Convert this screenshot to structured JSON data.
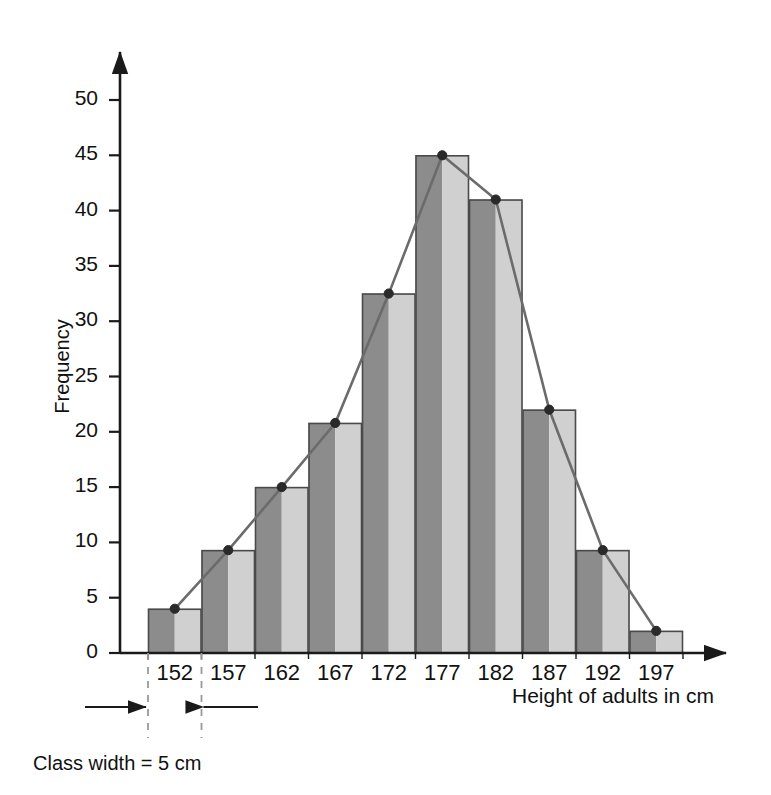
{
  "chart_data": {
    "type": "bar",
    "title": "",
    "subtitle": "",
    "xlabel": "Height of adults in cm",
    "ylabel": "Frequency",
    "categories": [
      "152",
      "157",
      "162",
      "167",
      "172",
      "177",
      "182",
      "187",
      "192",
      "197"
    ],
    "values": [
      4,
      9.3,
      15,
      20.8,
      32.5,
      45,
      41,
      22,
      9.3,
      2
    ],
    "series": [
      {
        "name": "Frequency",
        "values": [
          4,
          9.3,
          15,
          20.8,
          32.5,
          45,
          41,
          22,
          9.3,
          2
        ]
      },
      {
        "name": "Frequency polygon",
        "values": [
          4,
          9.3,
          15,
          20.8,
          32.5,
          45,
          41,
          22,
          9.3,
          2
        ]
      }
    ],
    "ylim": [
      0,
      55
    ],
    "xlim": [
      0,
      10
    ],
    "yticks": [
      0,
      5,
      10,
      15,
      20,
      25,
      30,
      35,
      40,
      45,
      50
    ],
    "ytick_labels": [
      "0",
      "5",
      "10",
      "15",
      "20",
      "25",
      "30",
      "35",
      "40",
      "45",
      "50"
    ],
    "xtick_labels": [
      "152",
      "157",
      "162",
      "167",
      "172",
      "177",
      "182",
      "187",
      "192",
      "197"
    ],
    "grid": false,
    "legend": "none",
    "annotations": [
      {
        "name": "class-width",
        "text": "Class width = 5 cm",
        "value": 5,
        "unit": "cm"
      }
    ]
  },
  "axes": {
    "y_title": "Frequency",
    "x_title": "Height of adults in cm"
  },
  "annotation": {
    "class_width_text": "Class width = 5 cm"
  },
  "colors": {
    "bar_dark": "#8c8c8c",
    "bar_light": "#d0d0d0",
    "bar_edge": "#4a4a4a",
    "axis": "#1a1a1a",
    "polygon_line": "#6b6b6b",
    "marker": "#2a2a2a",
    "dashed_guide": "#9a9a9a",
    "background": "#ffffff"
  }
}
